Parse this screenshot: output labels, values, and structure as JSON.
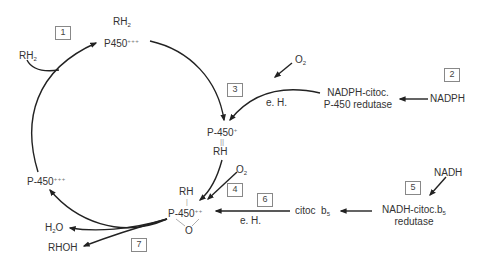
{
  "diagram": {
    "steps": [
      {
        "id": "step-1",
        "label": "1"
      },
      {
        "id": "step-2",
        "label": "2"
      },
      {
        "id": "step-3",
        "label": "3"
      },
      {
        "id": "step-4",
        "label": "4"
      },
      {
        "id": "step-5",
        "label": "5"
      },
      {
        "id": "step-6",
        "label": "6"
      },
      {
        "id": "step-7",
        "label": "7"
      }
    ],
    "nodes": {
      "substrate_in": {
        "base": "RH",
        "sub": "2"
      },
      "complex_top_substrate": {
        "base": "RH",
        "sub": "2"
      },
      "complex_top_enzyme": {
        "base": "P450",
        "sup": "+++"
      },
      "o2_top": {
        "base": "O",
        "sub": "2"
      },
      "eh_top": "e. H.",
      "nadph_reductase_line1": "NADPH-citoc.",
      "nadph_reductase_line2": "P-450 redutase",
      "nadph": "NADPH",
      "p450_plus": {
        "base": "P-450",
        "sup": "+"
      },
      "bond_double": "||",
      "rh_mid": "RH",
      "o2_mid": {
        "base": "O",
        "sub": "2"
      },
      "rh_left": "RH",
      "bond_single": "|",
      "p450_plusplus": {
        "base": "P-450",
        "sup": "++"
      },
      "oxygen": "O",
      "eh_bottom": "e. H.",
      "citoc_b5": {
        "base": "citoc  b",
        "sub": "5"
      },
      "nadh": "NADH",
      "nadh_reductase_line1": {
        "base": "NADH-citoc.b",
        "sub": "5"
      },
      "nadh_reductase_line2": "redutase",
      "p450_left": {
        "base": "P-450",
        "sup": "+++"
      },
      "water": {
        "pre": "H",
        "sub": "2",
        "post": "O"
      },
      "product": "RHOH"
    },
    "colors": {
      "line": "#222222",
      "text": "#333333",
      "box_border": "#888888"
    }
  }
}
